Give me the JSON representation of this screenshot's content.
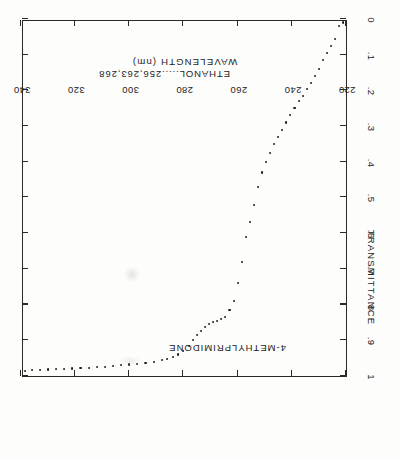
{
  "figure": {
    "rotation_degrees": 180,
    "compound_name": "4-METHYLPRIMIDONE",
    "solvent_note": "ETHANOL.....256,263,268",
    "ink_color": "#232323",
    "background_color": "#fdfdfc"
  },
  "chart_data": {
    "type": "scatter",
    "title": "4-METHYLPRIMIDONE",
    "annotations": [
      "4-METHYLPRIMIDONE",
      "ETHANOL.....256,263,268"
    ],
    "xlabel": "WAVELENGTH (nm)",
    "ylabel": "TRANSMITTANCE",
    "xlim": [
      220,
      340
    ],
    "ylim": [
      0,
      1
    ],
    "xticks": [
      220,
      240,
      260,
      280,
      300,
      320,
      340
    ],
    "xticklabels": [
      "220",
      "240",
      "260",
      "280",
      "300",
      "320",
      "340"
    ],
    "yticks": [
      0,
      0.1,
      0.2,
      0.3,
      0.4,
      0.5,
      0.6,
      0.7,
      0.8,
      0.9,
      1.0
    ],
    "yticklabels": [
      "0",
      ".1",
      ".2",
      ".3",
      ".4",
      ".5",
      ".6",
      ".7",
      ".8",
      ".9",
      "1"
    ],
    "grid": false,
    "legend": null,
    "x": [
      221,
      222.5,
      224,
      225.5,
      227,
      228.5,
      230,
      231.5,
      233,
      234.5,
      236,
      237.5,
      239,
      240.5,
      242,
      243.5,
      245,
      246.5,
      248,
      249.5,
      251,
      252.5,
      254,
      255.5,
      257,
      258.5,
      260,
      261.5,
      263,
      264.5,
      266,
      267.5,
      269,
      270.5,
      272,
      273.5,
      275,
      276.5,
      278,
      280,
      282,
      284,
      286,
      288,
      291,
      294,
      297,
      300,
      303,
      306,
      309,
      312,
      315,
      318,
      321,
      324,
      327,
      330,
      333,
      336,
      338.5
    ],
    "y": [
      0.01,
      0.02,
      0.055,
      0.075,
      0.095,
      0.115,
      0.14,
      0.16,
      0.18,
      0.195,
      0.215,
      0.23,
      0.25,
      0.27,
      0.29,
      0.31,
      0.33,
      0.35,
      0.375,
      0.4,
      0.43,
      0.47,
      0.52,
      0.57,
      0.61,
      0.68,
      0.74,
      0.79,
      0.815,
      0.835,
      0.84,
      0.845,
      0.85,
      0.855,
      0.862,
      0.875,
      0.885,
      0.9,
      0.915,
      0.93,
      0.94,
      0.948,
      0.952,
      0.956,
      0.96,
      0.963,
      0.966,
      0.968,
      0.97,
      0.972,
      0.974,
      0.976,
      0.977,
      0.978,
      0.979,
      0.98,
      0.981,
      0.982,
      0.983,
      0.984,
      0.985
    ]
  }
}
